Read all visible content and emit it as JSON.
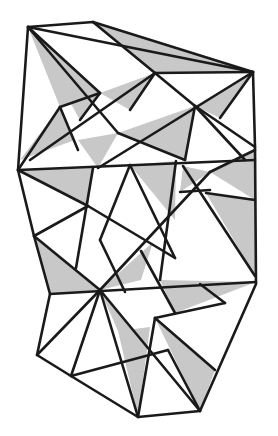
{
  "figure": {
    "colors": {
      "stroke": "#1a1a1a",
      "shade": "#c8c8c8",
      "background": "#ffffff"
    },
    "vertices": {
      "A": [
        28,
        27
      ],
      "B": [
        93,
        22
      ],
      "C": [
        253,
        72
      ],
      "D": [
        254,
        147
      ],
      "E": [
        18,
        170
      ],
      "F": [
        34,
        236
      ],
      "G": [
        50,
        294
      ],
      "H": [
        37,
        355
      ],
      "I": [
        71,
        376
      ],
      "J": [
        138,
        417
      ],
      "K": [
        200,
        411
      ],
      "L": [
        255,
        276
      ],
      "M": [
        256,
        284
      ],
      "P1": [
        60,
        107
      ],
      "P2": [
        100,
        93
      ],
      "P3": [
        114,
        69
      ],
      "P4": [
        155,
        73
      ],
      "P5": [
        152,
        80
      ],
      "P6": [
        128,
        111
      ],
      "P7": [
        118,
        133
      ],
      "P8": [
        148,
        128
      ],
      "P9": [
        195,
        106
      ],
      "P10": [
        170,
        146
      ],
      "P11": [
        93,
        168
      ],
      "P12": [
        216,
        92
      ],
      "P13": [
        88,
        206
      ],
      "P14": [
        136,
        207
      ],
      "P15": [
        180,
        192
      ],
      "P16": [
        206,
        193
      ],
      "P17": [
        210,
        172
      ],
      "P18": [
        183,
        166
      ],
      "P19": [
        153,
        242
      ],
      "P20": [
        100,
        290
      ],
      "P21": [
        160,
        280
      ],
      "P22": [
        141,
        251
      ],
      "P23": [
        77,
        258
      ],
      "P24": [
        171,
        313
      ],
      "P25": [
        118,
        331
      ],
      "P26": [
        150,
        327
      ],
      "P27": [
        166,
        359
      ],
      "P28": [
        225,
        303
      ]
    },
    "shaded_triangles": [
      [
        "A",
        "P1",
        "P2"
      ],
      [
        "B",
        "C",
        "P4"
      ],
      [
        "P1",
        "E",
        "P6"
      ],
      [
        "P6",
        "P7",
        "P2"
      ],
      [
        "P3",
        "P5",
        "P9"
      ],
      [
        "P7",
        "P10",
        "P8"
      ],
      [
        "P12",
        "C",
        "P9"
      ],
      [
        "E",
        "P11",
        "P13"
      ],
      [
        "P11",
        "P10",
        "P14"
      ],
      [
        "P17",
        "D",
        "P16"
      ],
      [
        "P18",
        "P15",
        "P17"
      ],
      [
        "P16",
        "L",
        "P19"
      ],
      [
        "F",
        "G",
        "P14"
      ],
      [
        "P20",
        "P21",
        "P22"
      ],
      [
        "P21",
        "M",
        "P24"
      ],
      [
        "P20",
        "P25",
        "P26"
      ],
      [
        "P24",
        "P27",
        "K"
      ],
      [
        "P25",
        "J",
        "P26"
      ]
    ]
  }
}
